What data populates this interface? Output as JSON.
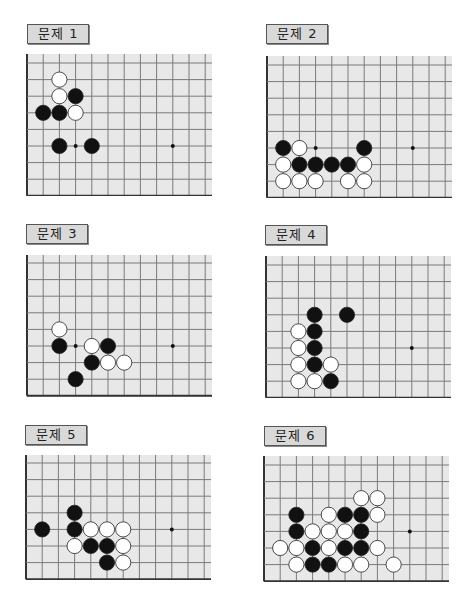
{
  "colors": {
    "board_bg": "#e8e8e8",
    "grid_line": "#7a7a7a",
    "edge_line": "#333333",
    "black_stone": "#111111",
    "white_stone": "#ffffff",
    "label_bg": "#d9d9d9"
  },
  "grid": {
    "spacing_x": 16.2,
    "spacing_y": 16.6
  },
  "problems": [
    {
      "label": "문제 1",
      "pos": {
        "x": 0,
        "y": 0
      },
      "label_pos": {
        "x": 27,
        "y": 24
      },
      "board": {
        "x": 26,
        "y": 54,
        "w": 186,
        "h": 142,
        "rows": 9,
        "first_row_y": 9
      },
      "star_points": [
        [
          3,
          5
        ],
        [
          9,
          5
        ]
      ],
      "stones": [
        {
          "c": "W",
          "x": 2,
          "y": 1
        },
        {
          "c": "W",
          "x": 2,
          "y": 2
        },
        {
          "c": "B",
          "x": 3,
          "y": 2
        },
        {
          "c": "B",
          "x": 1,
          "y": 3
        },
        {
          "c": "B",
          "x": 2,
          "y": 3
        },
        {
          "c": "W",
          "x": 3,
          "y": 3
        },
        {
          "c": "B",
          "x": 2,
          "y": 5
        },
        {
          "c": "B",
          "x": 4,
          "y": 5
        }
      ]
    },
    {
      "label": "문제 2",
      "pos": {
        "x": 0,
        "y": 0
      },
      "label_pos": {
        "x": 266,
        "y": 24
      },
      "board": {
        "x": 266,
        "y": 56,
        "w": 186,
        "h": 142,
        "rows": 9,
        "first_row_y": 9
      },
      "star_points": [
        [
          3,
          5
        ],
        [
          9,
          5
        ]
      ],
      "stones": [
        {
          "c": "B",
          "x": 1,
          "y": 5
        },
        {
          "c": "W",
          "x": 2,
          "y": 5
        },
        {
          "c": "B",
          "x": 6,
          "y": 5
        },
        {
          "c": "W",
          "x": 1,
          "y": 6
        },
        {
          "c": "B",
          "x": 2,
          "y": 6
        },
        {
          "c": "B",
          "x": 3,
          "y": 6
        },
        {
          "c": "B",
          "x": 4,
          "y": 6
        },
        {
          "c": "B",
          "x": 5,
          "y": 6
        },
        {
          "c": "W",
          "x": 6,
          "y": 6
        },
        {
          "c": "W",
          "x": 1,
          "y": 7
        },
        {
          "c": "W",
          "x": 2,
          "y": 7
        },
        {
          "c": "W",
          "x": 3,
          "y": 7
        },
        {
          "c": "W",
          "x": 5,
          "y": 7
        },
        {
          "c": "W",
          "x": 6,
          "y": 7
        }
      ]
    },
    {
      "label": "문제 3",
      "pos": {
        "x": 0,
        "y": 0
      },
      "label_pos": {
        "x": 26,
        "y": 224
      },
      "board": {
        "x": 26,
        "y": 255,
        "w": 186,
        "h": 142,
        "rows": 9,
        "first_row_y": 8
      },
      "star_points": [
        [
          3,
          5
        ],
        [
          9,
          5
        ]
      ],
      "stones": [
        {
          "c": "W",
          "x": 2,
          "y": 4
        },
        {
          "c": "B",
          "x": 2,
          "y": 5
        },
        {
          "c": "W",
          "x": 4,
          "y": 5
        },
        {
          "c": "B",
          "x": 5,
          "y": 5
        },
        {
          "c": "B",
          "x": 4,
          "y": 6
        },
        {
          "c": "W",
          "x": 5,
          "y": 6
        },
        {
          "c": "W",
          "x": 6,
          "y": 6
        },
        {
          "c": "B",
          "x": 3,
          "y": 7
        }
      ]
    },
    {
      "label": "문제 4",
      "pos": {
        "x": 0,
        "y": 0
      },
      "label_pos": {
        "x": 265,
        "y": 225
      },
      "board": {
        "x": 265,
        "y": 256,
        "w": 186,
        "h": 142,
        "rows": 9,
        "first_row_y": 9
      },
      "star_points": [
        [
          9,
          5
        ]
      ],
      "stones": [
        {
          "c": "B",
          "x": 3,
          "y": 3
        },
        {
          "c": "B",
          "x": 5,
          "y": 3
        },
        {
          "c": "W",
          "x": 2,
          "y": 4
        },
        {
          "c": "B",
          "x": 3,
          "y": 4
        },
        {
          "c": "W",
          "x": 2,
          "y": 5
        },
        {
          "c": "B",
          "x": 3,
          "y": 5
        },
        {
          "c": "W",
          "x": 2,
          "y": 6
        },
        {
          "c": "B",
          "x": 3,
          "y": 6
        },
        {
          "c": "W",
          "x": 4,
          "y": 6
        },
        {
          "c": "W",
          "x": 2,
          "y": 7
        },
        {
          "c": "W",
          "x": 3,
          "y": 7
        },
        {
          "c": "B",
          "x": 4,
          "y": 7
        }
      ]
    },
    {
      "label": "문제 5",
      "pos": {
        "x": 0,
        "y": 0
      },
      "label_pos": {
        "x": 25,
        "y": 425
      },
      "board": {
        "x": 25,
        "y": 455,
        "w": 186,
        "h": 125,
        "rows": 8,
        "first_row_y": 8
      },
      "star_points": [
        [
          9,
          4
        ]
      ],
      "stones": [
        {
          "c": "B",
          "x": 3,
          "y": 3
        },
        {
          "c": "B",
          "x": 1,
          "y": 4
        },
        {
          "c": "B",
          "x": 3,
          "y": 4
        },
        {
          "c": "W",
          "x": 4,
          "y": 4
        },
        {
          "c": "W",
          "x": 5,
          "y": 4
        },
        {
          "c": "W",
          "x": 6,
          "y": 4
        },
        {
          "c": "W",
          "x": 3,
          "y": 5
        },
        {
          "c": "B",
          "x": 4,
          "y": 5
        },
        {
          "c": "B",
          "x": 5,
          "y": 5
        },
        {
          "c": "W",
          "x": 6,
          "y": 5
        },
        {
          "c": "B",
          "x": 5,
          "y": 6
        },
        {
          "c": "W",
          "x": 6,
          "y": 6
        }
      ]
    },
    {
      "label": "문제 6",
      "pos": {
        "x": 0,
        "y": 0
      },
      "label_pos": {
        "x": 264,
        "y": 426
      },
      "board": {
        "x": 263,
        "y": 456,
        "w": 186,
        "h": 126,
        "rows": 8,
        "first_row_y": 9
      },
      "star_points": [
        [
          9,
          4
        ]
      ],
      "stones": [
        {
          "c": "W",
          "x": 6,
          "y": 2
        },
        {
          "c": "W",
          "x": 7,
          "y": 2
        },
        {
          "c": "B",
          "x": 2,
          "y": 3
        },
        {
          "c": "W",
          "x": 4,
          "y": 3
        },
        {
          "c": "B",
          "x": 5,
          "y": 3
        },
        {
          "c": "B",
          "x": 6,
          "y": 3
        },
        {
          "c": "W",
          "x": 7,
          "y": 3
        },
        {
          "c": "B",
          "x": 2,
          "y": 4
        },
        {
          "c": "W",
          "x": 3,
          "y": 4
        },
        {
          "c": "W",
          "x": 4,
          "y": 4
        },
        {
          "c": "W",
          "x": 5,
          "y": 4
        },
        {
          "c": "B",
          "x": 6,
          "y": 4
        },
        {
          "c": "W",
          "x": 1,
          "y": 5
        },
        {
          "c": "W",
          "x": 2,
          "y": 5
        },
        {
          "c": "B",
          "x": 3,
          "y": 5
        },
        {
          "c": "W",
          "x": 4,
          "y": 5
        },
        {
          "c": "B",
          "x": 5,
          "y": 5
        },
        {
          "c": "B",
          "x": 6,
          "y": 5
        },
        {
          "c": "W",
          "x": 7,
          "y": 5
        },
        {
          "c": "W",
          "x": 2,
          "y": 6
        },
        {
          "c": "B",
          "x": 3,
          "y": 6
        },
        {
          "c": "B",
          "x": 4,
          "y": 6
        },
        {
          "c": "W",
          "x": 5,
          "y": 6
        },
        {
          "c": "W",
          "x": 6,
          "y": 6
        },
        {
          "c": "W",
          "x": 8,
          "y": 6
        }
      ]
    }
  ]
}
